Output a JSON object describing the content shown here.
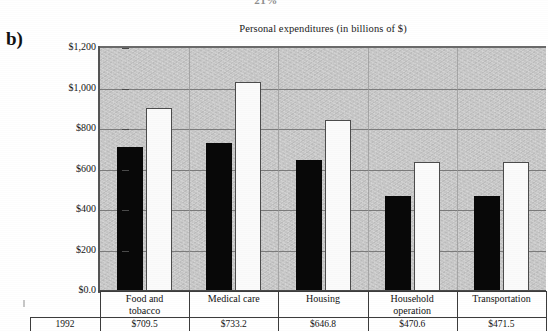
{
  "figure": {
    "panel_label": "b)",
    "top_clipped_text": "21%"
  },
  "chart_data": {
    "type": "bar",
    "title": "Personal expenditures (in billions of $)",
    "xlabel": "",
    "ylabel": "",
    "ylim": [
      0,
      1200
    ],
    "grid": true,
    "legend": "none",
    "categories": [
      "Food and tobacco",
      "Medical care",
      "Housing",
      "Household operation",
      "Transportation"
    ],
    "category_lines": [
      [
        "Food and",
        "tobacco"
      ],
      [
        "Medical care",
        ""
      ],
      [
        "Housing",
        ""
      ],
      [
        "Household",
        "operation"
      ],
      [
        "Transportation",
        ""
      ]
    ],
    "ytick_labels": [
      "$1,200",
      "$1,000",
      "$800",
      "$600",
      "$400",
      "$200",
      "$0.0"
    ],
    "ytick_values": [
      1200,
      1000,
      800,
      600,
      400,
      200,
      0
    ],
    "series": [
      {
        "name": "1992",
        "color": "#080808",
        "values": [
          709.5,
          733.2,
          646.8,
          470.6,
          471.5
        ]
      },
      {
        "name": "2000",
        "color": "#fbfbfb",
        "values": [
          905,
          1030,
          845,
          635,
          635
        ]
      }
    ]
  },
  "table": {
    "row_label": "1992",
    "values": [
      "$709.5",
      "$733.2",
      "$646.8",
      "$470.6",
      "$471.5"
    ]
  }
}
